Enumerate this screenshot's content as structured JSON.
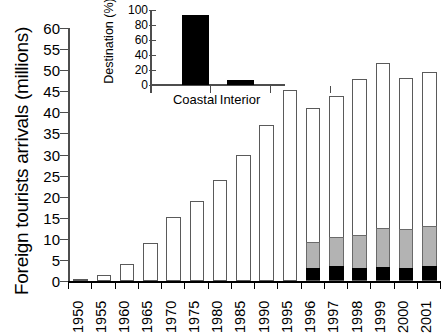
{
  "chart_data": {
    "type": "bar",
    "title": "",
    "xlabel": "",
    "ylabel": "Foreign tourists arrivals (millions)",
    "ylim": [
      0,
      60
    ],
    "yticks": [
      0,
      5,
      10,
      15,
      20,
      25,
      30,
      35,
      40,
      45,
      50,
      55,
      60
    ],
    "grid": false,
    "legend": "none",
    "categories": [
      "1950",
      "1955",
      "1960",
      "1965",
      "1970",
      "1975",
      "1980",
      "1985",
      "1990",
      "1995",
      "1996",
      "1997",
      "1998",
      "1999",
      "2000",
      "2001"
    ],
    "values": [
      0.3,
      1.5,
      4.0,
      9.1,
      15.3,
      19.0,
      24.0,
      30.0,
      37.0,
      45.2,
      41.0,
      43.8,
      47.8,
      51.7,
      48.2,
      49.5
    ],
    "series": [
      {
        "name": "bottom-segment",
        "color": "#000000",
        "values": [
          null,
          null,
          null,
          null,
          null,
          null,
          null,
          null,
          null,
          null,
          2.8,
          3.3,
          2.8,
          3.0,
          2.8,
          3.4
        ]
      },
      {
        "name": "middle-segment",
        "color": "#b3b3b3",
        "values": [
          null,
          null,
          null,
          null,
          null,
          null,
          null,
          null,
          null,
          null,
          9.1,
          10.1,
          10.7,
          12.4,
          12.2,
          12.7
        ]
      },
      {
        "name": "total",
        "color": "#ffffff",
        "values": [
          0.3,
          1.5,
          4.0,
          9.1,
          15.3,
          19.0,
          24.0,
          30.0,
          37.0,
          45.2,
          41.0,
          43.8,
          47.8,
          51.7,
          48.2,
          49.5
        ]
      }
    ]
  },
  "inset_chart": {
    "type": "bar",
    "title": "",
    "ylabel": "Destination (%)",
    "ylim": [
      0,
      100
    ],
    "yticks": [
      0,
      20,
      40,
      60,
      80,
      100
    ],
    "categories": [
      "Coastal",
      "Interior"
    ],
    "values": [
      93,
      7
    ],
    "color": "#000000",
    "grid": false
  }
}
